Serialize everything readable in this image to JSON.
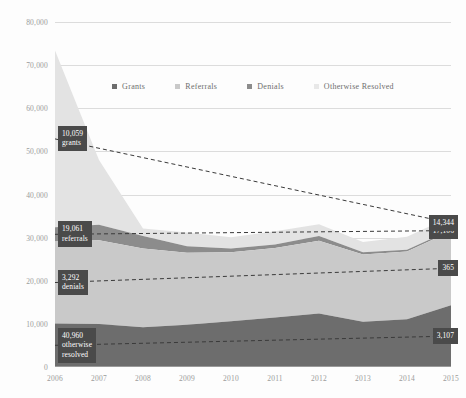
{
  "chart_data": {
    "type": "area",
    "stacked": true,
    "title": "",
    "xlabel": "",
    "ylabel": "",
    "categories": [
      "2006",
      "2007",
      "2008",
      "2009",
      "2010",
      "2011",
      "2012",
      "2013",
      "2014",
      "2015"
    ],
    "ylim": [
      0,
      80000
    ],
    "xlim": [
      "2006",
      "2015"
    ],
    "yticks": [
      "0",
      "10,000",
      "20,000",
      "30,000",
      "40,000",
      "50,000",
      "60,000",
      "70,000",
      "80,000"
    ],
    "ytick_values": [
      0,
      10000,
      20000,
      30000,
      40000,
      50000,
      60000,
      70000,
      80000
    ],
    "grid": true,
    "legend_position": "top-center",
    "series": [
      {
        "name": "Grants",
        "color": "#6d6d6d",
        "values": [
          10059,
          9980,
          9200,
          9800,
          10600,
          11500,
          12400,
          10500,
          11100,
          14344
        ]
      },
      {
        "name": "Referrals",
        "color": "#c9c9c9",
        "values": [
          19061,
          19400,
          18300,
          16700,
          16000,
          16100,
          16900,
          15600,
          15700,
          17106
        ]
      },
      {
        "name": "Denials",
        "color": "#8c8c8c",
        "values": [
          3292,
          3600,
          2900,
          1500,
          900,
          800,
          1100,
          500,
          400,
          365
        ]
      },
      {
        "name": "Otherwise Resolved",
        "color": "#e3e3e3",
        "values": [
          40960,
          15000,
          1700,
          3200,
          2600,
          3100,
          2700,
          2400,
          3000,
          3107
        ]
      }
    ],
    "trendlines": [
      {
        "name": "Grants trend",
        "start": 10059,
        "end": 14344
      },
      {
        "name": "Referrals trend",
        "start": 19061,
        "end": 17106
      },
      {
        "name": "Denials trend",
        "start": 3292,
        "end": 365
      },
      {
        "name": "Otherwise Resolved trend",
        "start": 40960,
        "end": 3107
      }
    ]
  },
  "legend": {
    "items": [
      {
        "label": "Grants",
        "color": "#6d6d6d"
      },
      {
        "label": "Referrals",
        "color": "#c9c9c9"
      },
      {
        "label": "Denials",
        "color": "#8c8c8c"
      },
      {
        "label": "Otherwise Resolved",
        "color": "#e8e8e8"
      }
    ]
  },
  "callouts": {
    "left": [
      {
        "name": "otherwise-resolved",
        "value": "40,960",
        "line2": "otherwise",
        "line3": "resolved"
      },
      {
        "name": "denials",
        "value": "3,292",
        "line2": "denials",
        "line3": ""
      },
      {
        "name": "referrals",
        "value": "19,061",
        "line2": "referrals",
        "line3": ""
      },
      {
        "name": "grants",
        "value": "10,059",
        "line2": "grants",
        "line3": ""
      }
    ],
    "right": [
      {
        "name": "otherwise-resolved",
        "value": "3,107"
      },
      {
        "name": "denials",
        "value": "365"
      },
      {
        "name": "referrals",
        "value": "17,106"
      },
      {
        "name": "grants",
        "value": "14,344"
      }
    ]
  },
  "colors": {
    "grants": "#6d6d6d",
    "referrals": "#c9c9c9",
    "denials": "#8c8c8c",
    "otherwise_resolved": "#e3e3e3",
    "callout_bg": "#4a4a4a",
    "grid": "#dcdcdc",
    "tick_text": "#9b9b9b"
  }
}
